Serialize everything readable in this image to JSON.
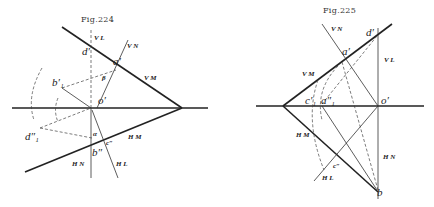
{
  "figures": [
    {
      "title": "Fig.224",
      "trace_labels": {
        "vl": "V L",
        "vn": "V N",
        "vm": "V M",
        "hm": "H M",
        "hn": "H N",
        "hl": "H L"
      },
      "point_labels": {
        "d_prime": "d′",
        "a_prime": "a′",
        "b1_prime": "b′₁",
        "o_prime": "o′",
        "d1_dprime": "d″₁",
        "b_dprime": "b″",
        "c_dprime": "c″",
        "alpha": "α",
        "beta": "β"
      }
    },
    {
      "title": "Fig.225",
      "trace_labels": {
        "vn": "V N",
        "vl": "V L",
        "vm": "V M",
        "hm": "H M",
        "hn": "H N",
        "hl": "H L"
      },
      "point_labels": {
        "d_prime": "d′",
        "a_prime": "a′",
        "c1_prime": "c′₁",
        "a1_dprime": "a″₁",
        "o_prime": "o′",
        "c_dprime": "c″",
        "b": "b"
      }
    }
  ]
}
